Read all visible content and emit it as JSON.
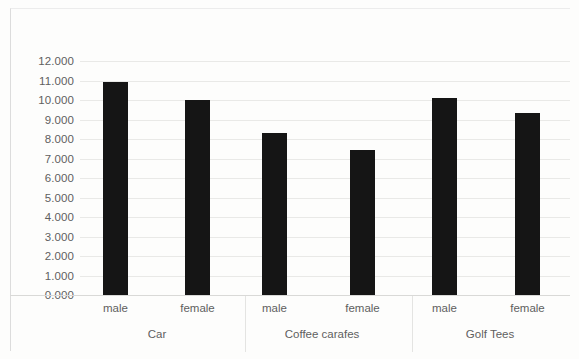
{
  "chart_data": {
    "type": "bar",
    "title": "",
    "subtitle": "",
    "xlabel": "",
    "ylabel": "",
    "ylim": [
      0,
      12
    ],
    "ytick_labels": [
      "12.000",
      "11.000",
      "10.000",
      "9.000",
      "8.000",
      "7.000",
      "6.000",
      "5.000",
      "4.000",
      "3.000",
      "2.000",
      "1.000",
      "0.000"
    ],
    "ytick_values": [
      12,
      11,
      10,
      9,
      8,
      7,
      6,
      5,
      4,
      3,
      2,
      1,
      0
    ],
    "grid": true,
    "legend": "none",
    "groups": [
      "Car",
      "Coffee carafes",
      "Golf Tees"
    ],
    "categories": [
      "male",
      "female",
      "male",
      "female",
      "male",
      "female"
    ],
    "values": [
      10.9,
      10.0,
      8.3,
      7.45,
      10.1,
      9.35
    ],
    "bars": [
      {
        "group": "Car",
        "series": "male",
        "value": 10.9
      },
      {
        "group": "Car",
        "series": "female",
        "value": 10.0
      },
      {
        "group": "Coffee carafes",
        "series": "male",
        "value": 8.3
      },
      {
        "group": "Coffee carafes",
        "series": "female",
        "value": 7.45
      },
      {
        "group": "Golf Tees",
        "series": "male",
        "value": 10.1
      },
      {
        "group": "Golf Tees",
        "series": "female",
        "value": 9.35
      }
    ],
    "colors": {
      "bar": "#151515",
      "gridline": "#e9e9e7",
      "axis_text": "#5f5f5f",
      "background": "#fdfdfc"
    }
  }
}
